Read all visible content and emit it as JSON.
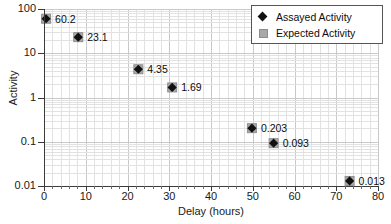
{
  "chart_data": {
    "type": "scatter",
    "title": "",
    "xlabel": "Delay (hours)",
    "ylabel": "Activity",
    "xlim": [
      0,
      80
    ],
    "ylim": [
      0.01,
      100
    ],
    "yscale": "log",
    "grid": true,
    "legend_position": "top-right",
    "x_ticks": [
      0,
      10,
      20,
      30,
      40,
      50,
      60,
      70,
      80
    ],
    "x_tick_labels": [
      "0",
      "10",
      "20",
      "30",
      "40",
      "50",
      "60",
      "70",
      "80"
    ],
    "y_ticks": [
      0.01,
      0.1,
      1,
      10,
      100
    ],
    "y_tick_labels": [
      "0.01",
      "0.1",
      "1",
      "10",
      "100"
    ],
    "series": [
      {
        "name": "Assayed Activity",
        "marker": "diamond",
        "color": "#111111",
        "points": [
          {
            "x": 0.5,
            "y": 60.2,
            "label": "60.2"
          },
          {
            "x": 8.2,
            "y": 23.1,
            "label": "23.1"
          },
          {
            "x": 22.6,
            "y": 4.35,
            "label": "4.35"
          },
          {
            "x": 30.7,
            "y": 1.69,
            "label": "1.69"
          },
          {
            "x": 49.8,
            "y": 0.203,
            "label": "0.203"
          },
          {
            "x": 55.0,
            "y": 0.093,
            "label": "0.093"
          },
          {
            "x": 73.2,
            "y": 0.013,
            "label": "0.013"
          }
        ]
      },
      {
        "name": "Expected Activity",
        "marker": "square",
        "color": "#a8a8a8",
        "points": [
          {
            "x": 0.5,
            "y": 60.2
          },
          {
            "x": 8.2,
            "y": 23.1
          },
          {
            "x": 22.6,
            "y": 4.35
          },
          {
            "x": 30.7,
            "y": 1.69
          },
          {
            "x": 49.8,
            "y": 0.203
          },
          {
            "x": 55.0,
            "y": 0.093
          },
          {
            "x": 73.2,
            "y": 0.013
          }
        ]
      }
    ]
  },
  "legend": {
    "entries": [
      {
        "label": "Assayed Activity",
        "marker": "diamond"
      },
      {
        "label": "Expected Activity",
        "marker": "square"
      }
    ]
  },
  "axes": {
    "x_title": "Delay (hours)",
    "y_title": "Activity"
  },
  "colors": {
    "assayed": "#111111",
    "expected": "#a8a8a8",
    "grid_minor": "#e2e2e2",
    "grid_major": "#c9c9c9",
    "axis": "#3a3a3a"
  }
}
